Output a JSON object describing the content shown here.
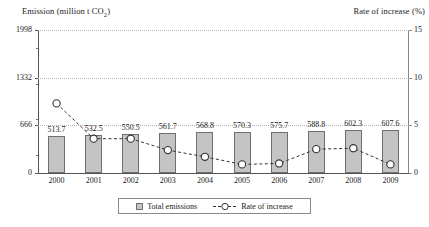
{
  "chart_data": {
    "type": "bar",
    "title": "",
    "categories": [
      "2000",
      "2001",
      "2002",
      "2003",
      "2004",
      "2005",
      "2006",
      "2007",
      "2008",
      "2009"
    ],
    "series": [
      {
        "name": "Total emissions",
        "type": "bar",
        "axis": "left",
        "values": [
          513.7,
          532.5,
          550.5,
          561.7,
          568.8,
          570.3,
          575.7,
          588.8,
          602.3,
          607.6
        ],
        "color": "#c4c4c4"
      },
      {
        "name": "Rate of increase",
        "type": "line",
        "axis": "right",
        "values": [
          7.3,
          3.6,
          3.6,
          2.4,
          1.7,
          0.9,
          1.0,
          2.5,
          2.6,
          0.9
        ],
        "marker": "open-circle",
        "dash": "dashed"
      }
    ],
    "xlabel": "",
    "ylabel_left": "Emission (million t CO2)",
    "ylabel_right": "Rate of increase (%)",
    "ylim_left": [
      0,
      1998
    ],
    "yticks_left": [
      "0",
      "666",
      "1332",
      "1998"
    ],
    "ylim_right": [
      0,
      15
    ],
    "yticks_right": [
      "0",
      "5",
      "10",
      "15"
    ],
    "grid": true,
    "legend_position": "bottom"
  },
  "axes": {
    "left_title_main": "Emission (million t CO",
    "left_title_sub": "2",
    "left_title_tail": ")",
    "right_title": "Rate of increase (%)"
  },
  "legend": {
    "items": [
      {
        "label": "Total emissions"
      },
      {
        "label": "Rate of increase"
      }
    ]
  }
}
